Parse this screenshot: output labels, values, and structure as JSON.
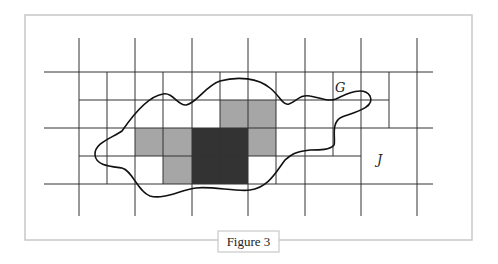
{
  "figure": {
    "caption": "Figure 3",
    "labels": {
      "region": "G",
      "set": "J"
    },
    "colors": {
      "light_cell": "#a6a6a6",
      "dark_cell": "#333333",
      "grid": "#333333",
      "frame": "#c8c8c8"
    },
    "grid": {
      "major_x": [
        79,
        135,
        192,
        248,
        305,
        361,
        417
      ],
      "major_y": [
        72,
        128,
        184
      ],
      "minor_y": [
        100,
        156
      ],
      "minor_x": [
        107,
        163,
        220,
        276,
        333,
        389
      ]
    },
    "shaded_cells": {
      "light": [
        {
          "x": 220,
          "y": 100,
          "w": 56,
          "h": 28
        },
        {
          "x": 135,
          "y": 128,
          "w": 57,
          "h": 28
        },
        {
          "x": 163,
          "y": 156,
          "w": 29,
          "h": 28
        },
        {
          "x": 248,
          "y": 128,
          "w": 28,
          "h": 28
        }
      ],
      "dark": [
        {
          "x": 192,
          "y": 128,
          "w": 56,
          "h": 56
        }
      ]
    }
  }
}
